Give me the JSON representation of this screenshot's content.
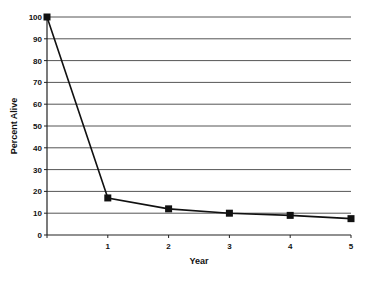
{
  "chart_data": {
    "type": "line",
    "title": "",
    "xlabel": "Year",
    "ylabel": "Percent Alive",
    "x": [
      0,
      1,
      2,
      3,
      4,
      5
    ],
    "x_tick_labels": [
      "",
      "1",
      "2",
      "3",
      "4",
      "5"
    ],
    "y_ticks": [
      0,
      10,
      20,
      30,
      40,
      50,
      60,
      70,
      80,
      90,
      100
    ],
    "ylim": [
      0,
      100
    ],
    "xlim": [
      0,
      5
    ],
    "grid": true,
    "legend": null,
    "series": [
      {
        "name": "Percent Alive",
        "values": [
          100,
          17,
          12,
          10,
          9,
          7.5
        ],
        "marker": "square",
        "color": "#111111"
      }
    ]
  },
  "colors": {
    "line": "#111111",
    "grid": "#555555",
    "axis": "#222222",
    "background": "#ffffff"
  }
}
